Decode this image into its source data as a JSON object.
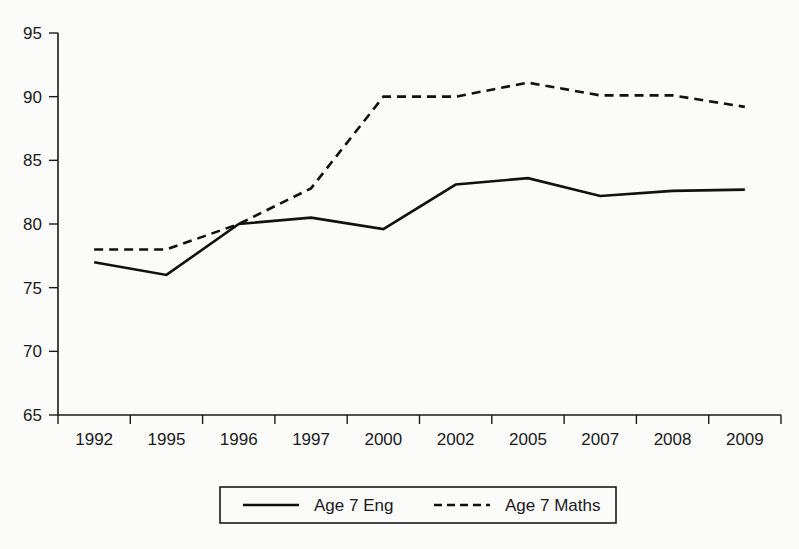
{
  "chart_data": {
    "type": "line",
    "title": "",
    "subtitle": "",
    "xlabel": "",
    "ylabel": "",
    "categories": [
      "1992",
      "1995",
      "1996",
      "1997",
      "2000",
      "2002",
      "2005",
      "2007",
      "2008",
      "2009"
    ],
    "x": [
      "1992",
      "1995",
      "1996",
      "1997",
      "2000",
      "2002",
      "2005",
      "2007",
      "2008",
      "2009"
    ],
    "series": [
      {
        "name": "Age 7 Eng",
        "style": "solid",
        "color": "#111111",
        "values": [
          77.0,
          76.0,
          80.0,
          80.5,
          79.6,
          83.1,
          83.6,
          82.2,
          82.6,
          82.7
        ]
      },
      {
        "name": "Age 7 Maths",
        "style": "dashed",
        "color": "#111111",
        "values": [
          78.0,
          78.0,
          80.0,
          82.8,
          90.0,
          90.0,
          91.1,
          90.1,
          90.1,
          89.2
        ]
      }
    ],
    "ylim": [
      65,
      95
    ],
    "yticks": [
      "65",
      "70",
      "75",
      "80",
      "85",
      "90",
      "95"
    ],
    "ytick_values": [
      65,
      70,
      75,
      80,
      85,
      90,
      95
    ],
    "grid": false,
    "legend_position": "bottom",
    "legend_entries": [
      {
        "label": "Age 7 Eng",
        "style": "solid"
      },
      {
        "label": "Age 7 Maths",
        "style": "dashed"
      }
    ]
  },
  "colors": {
    "background": "#fbfbfa",
    "axis": "#1a1a1a",
    "ink": "#111111"
  }
}
